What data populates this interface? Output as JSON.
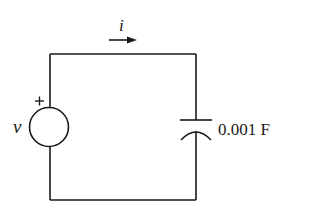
{
  "diagram": {
    "type": "circuit",
    "source": {
      "label": "v",
      "polarity": "+"
    },
    "current": {
      "label": "i",
      "direction": "right"
    },
    "capacitor": {
      "value": "0.001 F"
    }
  },
  "colors": {
    "line": "#1a1a1a",
    "background": "#ffffff"
  }
}
